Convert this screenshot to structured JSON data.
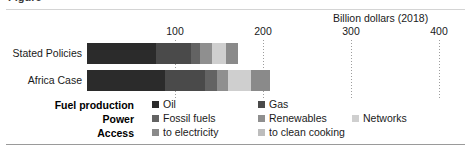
{
  "figure": {
    "title_cropped": "Figure",
    "unit_label": "Billion dollars (2018)"
  },
  "chart_data": {
    "type": "bar",
    "orientation": "horizontal",
    "stacked": true,
    "title": "",
    "subtitle": "",
    "xlabel": "Billion dollars (2018)",
    "ylabel": "",
    "xlim": [
      0,
      440
    ],
    "xticks": [
      100,
      200,
      300,
      400
    ],
    "xtick_labels": [
      "100",
      "200",
      "300",
      "400"
    ],
    "grid": "vertical-dotted",
    "legend_position": "bottom",
    "categories": [
      "Stated Policies",
      "Africa Case"
    ],
    "series": [
      {
        "name": "Oil",
        "group": "Fuel production",
        "color": "#2b2b2b",
        "values": [
          78,
          89
        ]
      },
      {
        "name": "Gas",
        "group": "Fuel production",
        "color": "#4a4a4a",
        "values": [
          40,
          45
        ]
      },
      {
        "name": "Fossil fuels",
        "group": "Power",
        "color": "#636363",
        "values": [
          11,
          14
        ]
      },
      {
        "name": "Renewables",
        "group": "Power",
        "color": "#8f8f8f",
        "values": [
          13,
          12
        ]
      },
      {
        "name": "Networks",
        "group": "Power",
        "color": "#cfcfcf",
        "values": [
          16,
          26
        ]
      },
      {
        "name": "to electricity",
        "group": "Access",
        "color": "#8a8a8a",
        "values": [
          14,
          22
        ]
      },
      {
        "name": "to clean cooking",
        "group": "Access",
        "color": "#bdbdbd",
        "values": [
          0,
          0
        ]
      }
    ],
    "totals": [
      172,
      208
    ]
  },
  "legend": {
    "rows": [
      {
        "group": "Fuel production",
        "items": [
          {
            "label": "Oil",
            "color": "#2b2b2b",
            "left": 152
          },
          {
            "label": "Gas",
            "color": "#4a4a4a",
            "left": 258
          }
        ]
      },
      {
        "group": "Power",
        "items": [
          {
            "label": "Fossil fuels",
            "color": "#636363",
            "left": 152
          },
          {
            "label": "Renewables",
            "color": "#8f8f8f",
            "left": 258
          },
          {
            "label": "Networks",
            "color": "#cfcfcf",
            "left": 352
          }
        ]
      },
      {
        "group": "Access",
        "items": [
          {
            "label": "to electricity",
            "color": "#8a8a8a",
            "left": 152
          },
          {
            "label": "to clean cooking",
            "color": "#bdbdbd",
            "left": 258
          }
        ]
      }
    ]
  }
}
